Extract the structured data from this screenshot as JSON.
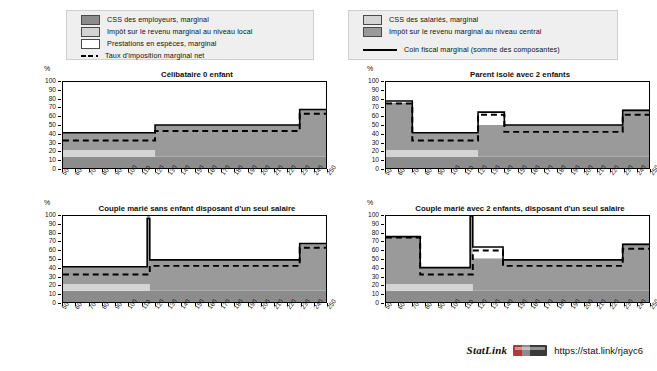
{
  "legend": {
    "left": {
      "items": [
        {
          "swatch": "dark-gray",
          "label": "CSS des employeurs, marginal"
        },
        {
          "swatch": "light-gray",
          "label": "Impôt sur le revenu marginal au niveau local"
        },
        {
          "swatch": "white",
          "label": "Prestations en espèces, marginal"
        },
        {
          "swatch": "dashed-line",
          "label": "Taux d'imposition marginal net"
        }
      ]
    },
    "right": {
      "items": [
        {
          "swatch": "light-gray",
          "label": "CSS des salariés, marginal"
        },
        {
          "swatch": "mid-gray",
          "label": "Impôt sur le revenu marginal au niveau central"
        },
        {
          "swatch": "solid-line",
          "label": "Coin fiscal marginal (somme des composantes)"
        }
      ]
    }
  },
  "axis": {
    "y_unit": "%",
    "y_ticks": [
      0,
      10,
      20,
      30,
      40,
      50,
      60,
      70,
      80,
      90,
      100
    ],
    "x_ticks": [
      50,
      60,
      70,
      80,
      90,
      100,
      110,
      120,
      130,
      140,
      150,
      160,
      170,
      180,
      190,
      200,
      210,
      220,
      230,
      240,
      250
    ]
  },
  "footer": {
    "statlink_word": "StatLink",
    "badge": "statlink-barcode-icon",
    "url": "https://stat.link/rjayc6"
  },
  "colors": {
    "employer_sc": "#8c8c8c",
    "local_income_tax": "#d4d4d4",
    "cash_benefits": "#ffffff",
    "employee_sc": "#d4d4d4",
    "central_income_tax": "#9a9a9a",
    "net_rate_line": "#000000",
    "wedge_line": "#000000",
    "panel_border": "#000000",
    "legend_bg": "#efefef"
  },
  "chart_data": [
    {
      "id": "celibataire-0-enfant",
      "type": "area",
      "title": "Célibataire 0 enfant",
      "xlabel": "",
      "ylabel": "%",
      "xlim": [
        50,
        250
      ],
      "ylim": [
        0,
        100
      ],
      "grid": false,
      "x": [
        50,
        60,
        70,
        80,
        90,
        100,
        110,
        115,
        120,
        130,
        140,
        150,
        160,
        170,
        180,
        190,
        200,
        210,
        220,
        228,
        230,
        240,
        250
      ],
      "series": [
        {
          "name": "CSS des employeurs, marginal",
          "stack": 1,
          "values": [
            13,
            13,
            13,
            13,
            13,
            13,
            13,
            13,
            13,
            13,
            13,
            13,
            13,
            13,
            13,
            13,
            13,
            13,
            13,
            13,
            13,
            13,
            13
          ]
        },
        {
          "name": "Impôt sur le revenu marginal au niveau local",
          "stack": 2,
          "values": [
            8,
            8,
            8,
            8,
            8,
            8,
            8,
            8,
            0,
            0,
            0,
            0,
            0,
            0,
            0,
            0,
            0,
            0,
            0,
            0,
            0,
            0,
            0
          ]
        },
        {
          "name": "CSS des salariés, marginal",
          "stack": 3,
          "values": [
            0,
            0,
            0,
            0,
            0,
            0,
            0,
            0,
            0,
            0,
            0,
            0,
            0,
            0,
            0,
            0,
            0,
            0,
            0,
            0,
            0,
            0,
            0
          ]
        },
        {
          "name": "Impôt sur le revenu marginal au niveau central",
          "stack": 4,
          "values": [
            20,
            20,
            20,
            20,
            20,
            20,
            20,
            20,
            37,
            37,
            37,
            37,
            37,
            37,
            37,
            37,
            37,
            37,
            37,
            37,
            55,
            55,
            55
          ]
        },
        {
          "name": "Prestations en espèces, marginal",
          "stack": 5,
          "values": [
            0,
            0,
            0,
            0,
            0,
            0,
            0,
            0,
            0,
            0,
            0,
            0,
            0,
            0,
            0,
            0,
            0,
            0,
            0,
            0,
            0,
            0,
            0
          ]
        }
      ],
      "lines": [
        {
          "name": "Coin fiscal marginal (somme des composantes)",
          "style": "solid",
          "values": [
            41,
            41,
            41,
            41,
            41,
            41,
            41,
            41,
            50,
            50,
            50,
            50,
            50,
            50,
            50,
            50,
            50,
            50,
            50,
            50,
            68,
            68,
            68
          ]
        },
        {
          "name": "Taux d'imposition marginal net",
          "style": "dashed",
          "values": [
            32,
            32,
            32,
            32,
            32,
            32,
            32,
            32,
            43,
            43,
            43,
            43,
            43,
            43,
            43,
            43,
            43,
            43,
            43,
            43,
            63,
            63,
            63
          ]
        }
      ]
    },
    {
      "id": "parent-isole-2-enfants",
      "type": "area",
      "title": "Parent isolé avec 2 enfants",
      "xlabel": "",
      "ylabel": "%",
      "xlim": [
        50,
        250
      ],
      "ylim": [
        0,
        100
      ],
      "grid": false,
      "x": [
        50,
        60,
        68,
        70,
        80,
        90,
        100,
        110,
        118,
        120,
        130,
        138,
        140,
        150,
        160,
        170,
        180,
        190,
        200,
        210,
        220,
        228,
        230,
        240,
        250
      ],
      "series": [
        {
          "name": "CSS des employeurs, marginal",
          "stack": 1,
          "values": [
            13,
            13,
            13,
            13,
            13,
            13,
            13,
            13,
            13,
            13,
            13,
            13,
            13,
            13,
            13,
            13,
            13,
            13,
            13,
            13,
            13,
            13,
            13,
            13,
            13
          ]
        },
        {
          "name": "Impôt sur le revenu marginal au niveau local",
          "stack": 2,
          "values": [
            8,
            8,
            8,
            8,
            8,
            8,
            8,
            8,
            8,
            0,
            0,
            0,
            0,
            0,
            0,
            0,
            0,
            0,
            0,
            0,
            0,
            0,
            0,
            0,
            0
          ]
        },
        {
          "name": "CSS des salariés, marginal",
          "stack": 3,
          "values": [
            0,
            0,
            0,
            0,
            0,
            0,
            0,
            0,
            0,
            0,
            0,
            0,
            0,
            0,
            0,
            0,
            0,
            0,
            0,
            0,
            0,
            0,
            0,
            0,
            0
          ]
        },
        {
          "name": "Impôt sur le revenu marginal au niveau central",
          "stack": 4,
          "values": [
            55,
            55,
            55,
            20,
            20,
            20,
            20,
            20,
            20,
            37,
            37,
            37,
            37,
            37,
            37,
            37,
            37,
            37,
            37,
            37,
            37,
            37,
            55,
            55,
            55
          ]
        },
        {
          "name": "Prestations en espèces, marginal",
          "stack": 5,
          "values": [
            0,
            0,
            0,
            0,
            0,
            0,
            0,
            0,
            0,
            15,
            15,
            15,
            0,
            0,
            0,
            0,
            0,
            0,
            0,
            0,
            0,
            0,
            0,
            0,
            0
          ]
        }
      ],
      "lines": [
        {
          "name": "Coin fiscal marginal (somme des composantes)",
          "style": "solid",
          "values": [
            78,
            78,
            78,
            41,
            41,
            41,
            41,
            41,
            41,
            65,
            65,
            65,
            50,
            50,
            50,
            50,
            50,
            50,
            50,
            50,
            50,
            50,
            67,
            67,
            67
          ]
        },
        {
          "name": "Taux d'imposition marginal net",
          "style": "dashed",
          "values": [
            75,
            75,
            75,
            32,
            32,
            32,
            32,
            32,
            32,
            62,
            62,
            62,
            42,
            42,
            42,
            42,
            42,
            42,
            42,
            42,
            42,
            42,
            62,
            62,
            62
          ]
        }
      ]
    },
    {
      "id": "couple-marie-sans-enfant",
      "type": "area",
      "title": "Couple marié sans enfant disposant d'un seul salaire",
      "xlabel": "",
      "ylabel": "%",
      "xlim": [
        50,
        250
      ],
      "ylim": [
        0,
        100
      ],
      "grid": false,
      "x": [
        50,
        60,
        70,
        80,
        90,
        100,
        110,
        114,
        116,
        118,
        120,
        130,
        140,
        150,
        160,
        170,
        180,
        190,
        200,
        210,
        220,
        228,
        230,
        240,
        250
      ],
      "series": [
        {
          "name": "CSS des employeurs, marginal",
          "stack": 1,
          "values": [
            13,
            13,
            13,
            13,
            13,
            13,
            13,
            13,
            13,
            13,
            13,
            13,
            13,
            13,
            13,
            13,
            13,
            13,
            13,
            13,
            13,
            13,
            13,
            13,
            13
          ]
        },
        {
          "name": "Impôt sur le revenu marginal au niveau local",
          "stack": 2,
          "values": [
            8,
            8,
            8,
            8,
            8,
            8,
            8,
            8,
            0,
            0,
            0,
            0,
            0,
            0,
            0,
            0,
            0,
            0,
            0,
            0,
            0,
            0,
            0,
            0,
            0
          ]
        },
        {
          "name": "CSS des salariés, marginal",
          "stack": 3,
          "values": [
            0,
            0,
            0,
            0,
            0,
            0,
            0,
            0,
            0,
            0,
            0,
            0,
            0,
            0,
            0,
            0,
            0,
            0,
            0,
            0,
            0,
            0,
            0,
            0,
            0
          ]
        },
        {
          "name": "Impôt sur le revenu marginal au niveau central",
          "stack": 4,
          "values": [
            20,
            20,
            20,
            20,
            20,
            20,
            20,
            84,
            36,
            36,
            36,
            36,
            36,
            36,
            36,
            36,
            36,
            36,
            36,
            36,
            36,
            36,
            55,
            55,
            55
          ]
        },
        {
          "name": "Prestations en espèces, marginal",
          "stack": 5,
          "values": [
            0,
            0,
            0,
            0,
            0,
            0,
            0,
            0,
            0,
            0,
            0,
            0,
            0,
            0,
            0,
            0,
            0,
            0,
            0,
            0,
            0,
            0,
            0,
            0,
            0
          ]
        }
      ],
      "lines": [
        {
          "name": "Coin fiscal marginal (somme des composantes)",
          "style": "solid",
          "values": [
            41,
            41,
            41,
            41,
            41,
            41,
            41,
            97,
            49,
            49,
            49,
            49,
            49,
            49,
            49,
            49,
            49,
            49,
            49,
            49,
            49,
            49,
            68,
            68,
            68
          ]
        },
        {
          "name": "Taux d'imposition marginal net",
          "style": "dashed",
          "values": [
            32,
            32,
            32,
            32,
            32,
            32,
            32,
            32,
            42,
            42,
            42,
            42,
            42,
            42,
            42,
            42,
            42,
            42,
            42,
            42,
            42,
            42,
            63,
            63,
            63
          ]
        }
      ]
    },
    {
      "id": "couple-marie-2-enfants",
      "type": "area",
      "title": "Couple marié avec 2 enfants, disposant d'un seul salaire",
      "xlabel": "",
      "ylabel": "%",
      "xlim": [
        50,
        250
      ],
      "ylim": [
        0,
        100
      ],
      "grid": false,
      "x": [
        50,
        60,
        70,
        74,
        76,
        80,
        90,
        100,
        110,
        114,
        116,
        120,
        130,
        137,
        139,
        140,
        150,
        160,
        170,
        180,
        190,
        200,
        210,
        220,
        228,
        230,
        240,
        250
      ],
      "series": [
        {
          "name": "CSS des employeurs, marginal",
          "stack": 1,
          "values": [
            13,
            13,
            13,
            13,
            13,
            13,
            13,
            13,
            13,
            13,
            13,
            13,
            13,
            13,
            13,
            13,
            13,
            13,
            13,
            13,
            13,
            13,
            13,
            13,
            13,
            13,
            13,
            13
          ]
        },
        {
          "name": "Impôt sur le revenu marginal au niveau local",
          "stack": 2,
          "values": [
            8,
            8,
            8,
            8,
            8,
            8,
            8,
            8,
            8,
            8,
            0,
            0,
            0,
            0,
            0,
            0,
            0,
            0,
            0,
            0,
            0,
            0,
            0,
            0,
            0,
            0,
            0,
            0
          ]
        },
        {
          "name": "CSS des salariés, marginal",
          "stack": 3,
          "values": [
            0,
            0,
            0,
            0,
            0,
            0,
            0,
            0,
            0,
            0,
            0,
            0,
            0,
            0,
            0,
            0,
            0,
            0,
            0,
            0,
            0,
            0,
            0,
            0,
            0,
            0,
            0,
            0
          ]
        },
        {
          "name": "Impôt sur le revenu marginal au niveau central",
          "stack": 4,
          "values": [
            55,
            55,
            55,
            55,
            19,
            19,
            19,
            19,
            19,
            100,
            38,
            38,
            38,
            38,
            36,
            36,
            36,
            36,
            36,
            36,
            36,
            36,
            36,
            36,
            36,
            55,
            55,
            55
          ]
        },
        {
          "name": "Prestations en espèces, marginal",
          "stack": 5,
          "values": [
            0,
            0,
            0,
            0,
            0,
            0,
            0,
            0,
            0,
            0,
            13,
            13,
            13,
            13,
            0,
            0,
            0,
            0,
            0,
            0,
            0,
            0,
            0,
            0,
            0,
            0,
            0,
            0
          ]
        }
      ],
      "lines": [
        {
          "name": "Coin fiscal marginal (somme des composantes)",
          "style": "solid",
          "values": [
            76,
            76,
            76,
            76,
            40,
            40,
            40,
            40,
            40,
            100,
            64,
            64,
            64,
            64,
            49,
            49,
            49,
            49,
            49,
            49,
            49,
            49,
            49,
            49,
            49,
            67,
            67,
            67
          ]
        },
        {
          "name": "Taux d'imposition marginal net",
          "style": "dashed",
          "values": [
            75,
            75,
            75,
            75,
            32,
            32,
            32,
            32,
            32,
            32,
            60,
            60,
            60,
            60,
            42,
            42,
            42,
            42,
            42,
            42,
            42,
            42,
            42,
            42,
            42,
            62,
            62,
            62
          ]
        }
      ]
    }
  ]
}
